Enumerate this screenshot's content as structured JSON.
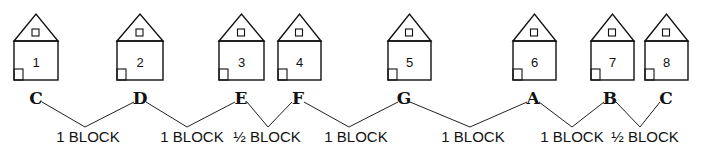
{
  "houses": [
    {
      "number": "1",
      "letter": "C",
      "x": 14,
      "w": 44
    },
    {
      "number": "2",
      "letter": "D",
      "x": 117,
      "w": 46
    },
    {
      "number": "3",
      "letter": "E",
      "x": 219,
      "w": 45
    },
    {
      "number": "4",
      "letter": "F",
      "x": 278,
      "w": 43
    },
    {
      "number": "5",
      "letter": "G",
      "x": 388,
      "w": 43
    },
    {
      "number": "6",
      "letter": "A",
      "x": 513,
      "w": 43
    },
    {
      "number": "7",
      "letter": "B",
      "x": 591,
      "w": 43
    },
    {
      "number": "8",
      "letter": "C",
      "x": 645,
      "w": 43
    }
  ],
  "letters": [
    {
      "text": "C",
      "x": 36
    },
    {
      "text": "D",
      "x": 140
    },
    {
      "text": "E",
      "x": 241
    },
    {
      "text": "F",
      "x": 298
    },
    {
      "text": "G",
      "x": 404
    },
    {
      "text": "A",
      "x": 533
    },
    {
      "text": "B",
      "x": 610
    },
    {
      "text": "C",
      "x": 666
    }
  ],
  "distances": [
    {
      "label": "1 BLOCK",
      "from": "C",
      "to": "D",
      "vx": 85,
      "lx": 88
    },
    {
      "label": "1 BLOCK",
      "from": "D",
      "to": "E",
      "vx": 187,
      "lx": 192
    },
    {
      "label": "½ BLOCK",
      "from": "E",
      "to": "F",
      "vx": 268,
      "lx": 267
    },
    {
      "label": "1 BLOCK",
      "from": "F",
      "to": "G",
      "vx": 349,
      "lx": 356
    },
    {
      "label": "1 BLOCK",
      "from": "G",
      "to": "A",
      "vx": 470,
      "lx": 473
    },
    {
      "label": "1 BLOCK",
      "from": "A",
      "to": "B",
      "vx": 572,
      "lx": 572
    },
    {
      "label": "½ BLOCK",
      "from": "B",
      "to": "C",
      "vx": 640,
      "lx": 645
    }
  ]
}
